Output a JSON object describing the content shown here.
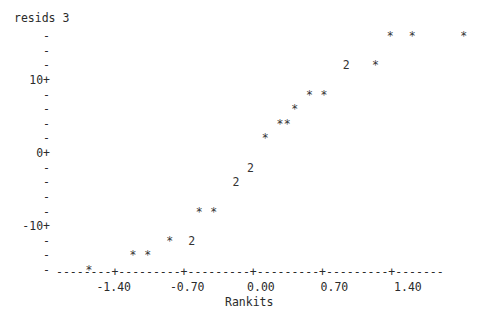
{
  "chart_data": {
    "type": "scatter",
    "title": "resids 3",
    "xlabel": "Rankits",
    "ylabel": "resids 3",
    "render_style": "ascii-character-plot",
    "point_marker": "*",
    "overlap_marker_note": "digit shows count of overlapping points",
    "xlim": [
      -1.75,
      -1.75
    ],
    "x_tick_labels": [
      "-1.40",
      "-0.70",
      "0.00",
      "0.70",
      "1.40"
    ],
    "x_tick_values": [
      -1.4,
      -0.7,
      0.0,
      0.7,
      1.4
    ],
    "y_tick_labels": [
      "10+",
      "0+",
      "-10+"
    ],
    "y_tick_values": [
      10,
      0,
      -10
    ],
    "grid": false,
    "legend": null,
    "points": [
      {
        "x": -1.75,
        "y": -14.5,
        "marker": "*",
        "count": 1
      },
      {
        "x": -1.33,
        "y": -13.0,
        "marker": "*",
        "count": 1
      },
      {
        "x": -1.1,
        "y": -13.0,
        "marker": "*",
        "count": 1
      },
      {
        "x": -0.92,
        "y": -11.5,
        "marker": "*",
        "count": 1
      },
      {
        "x": -0.66,
        "y": -11.5,
        "marker": "2",
        "count": 2
      },
      {
        "x": -0.5,
        "y": -8.5,
        "marker": "*",
        "count": 1
      },
      {
        "x": -0.34,
        "y": -8.5,
        "marker": "*",
        "count": 1
      },
      {
        "x": -0.16,
        "y": -5.5,
        "marker": "2",
        "count": 2
      },
      {
        "x": 0.06,
        "y": -4.0,
        "marker": "2",
        "count": 2
      },
      {
        "x": 0.11,
        "y": 1.0,
        "marker": "*",
        "count": 1
      },
      {
        "x": 0.2,
        "y": 2.5,
        "marker": "*",
        "count": 1
      },
      {
        "x": 0.28,
        "y": 2.5,
        "marker": "*",
        "count": 1
      },
      {
        "x": 0.37,
        "y": 4.0,
        "marker": "*",
        "count": 1
      },
      {
        "x": 0.5,
        "y": 5.5,
        "marker": "*",
        "count": 1
      },
      {
        "x": 0.62,
        "y": 5.5,
        "marker": "*",
        "count": 1
      },
      {
        "x": 0.8,
        "y": 8.5,
        "marker": "2",
        "count": 2
      },
      {
        "x": 1.1,
        "y": 8.5,
        "marker": "*",
        "count": 1
      },
      {
        "x": 1.28,
        "y": 11.5,
        "marker": "*",
        "count": 1
      },
      {
        "x": 1.5,
        "y": 11.5,
        "marker": "*",
        "count": 1
      },
      {
        "x": 2.0,
        "y": 11.5,
        "marker": "*",
        "count": 1
      }
    ]
  },
  "plot": {
    "title": "resids 3",
    "x_axis_title": "Rankits",
    "y_axis_rows": [
      {
        "label": "-",
        "kind": "minor"
      },
      {
        "label": "-",
        "kind": "minor"
      },
      {
        "label": "-",
        "kind": "minor"
      },
      {
        "label": "10+",
        "kind": "major"
      },
      {
        "label": "-",
        "kind": "minor"
      },
      {
        "label": "-",
        "kind": "minor"
      },
      {
        "label": "-",
        "kind": "minor"
      },
      {
        "label": "-",
        "kind": "minor"
      },
      {
        "label": "0+",
        "kind": "major"
      },
      {
        "label": "-",
        "kind": "minor"
      },
      {
        "label": "-",
        "kind": "minor"
      },
      {
        "label": "-",
        "kind": "minor"
      },
      {
        "label": "-",
        "kind": "minor"
      },
      {
        "label": "-10+",
        "kind": "major"
      },
      {
        "label": "-",
        "kind": "minor"
      },
      {
        "label": "-",
        "kind": "minor"
      },
      {
        "label": "-",
        "kind": "minor"
      }
    ],
    "axis_line": "--------+---------+---------+---------+---------+-------",
    "x_tick_labels": [
      "-1.40",
      "-0.70",
      "0.00",
      "0.70",
      "1.40"
    ],
    "data_rows": [
      {
        "row": 0,
        "marks": [
          {
            "col": 45,
            "ch": "*"
          },
          {
            "col": 48,
            "ch": "*"
          },
          {
            "col": 55,
            "ch": "*"
          }
        ]
      },
      {
        "row": 1,
        "marks": []
      },
      {
        "row": 2,
        "marks": [
          {
            "col": 39,
            "ch": "2"
          },
          {
            "col": 43,
            "ch": "*"
          }
        ]
      },
      {
        "row": 3,
        "marks": []
      },
      {
        "row": 4,
        "marks": [
          {
            "col": 34,
            "ch": "*"
          },
          {
            "col": 36,
            "ch": "*"
          }
        ]
      },
      {
        "row": 5,
        "marks": [
          {
            "col": 32,
            "ch": "*"
          }
        ]
      },
      {
        "row": 6,
        "marks": [
          {
            "col": 30,
            "ch": "*"
          },
          {
            "col": 31,
            "ch": "*"
          }
        ]
      },
      {
        "row": 7,
        "marks": [
          {
            "col": 28,
            "ch": "*"
          }
        ]
      },
      {
        "row": 8,
        "marks": []
      },
      {
        "row": 9,
        "marks": [
          {
            "col": 26,
            "ch": "2"
          }
        ]
      },
      {
        "row": 10,
        "marks": [
          {
            "col": 24,
            "ch": "2"
          }
        ]
      },
      {
        "row": 11,
        "marks": []
      },
      {
        "row": 12,
        "marks": [
          {
            "col": 19,
            "ch": "*"
          },
          {
            "col": 21,
            "ch": "*"
          }
        ]
      },
      {
        "row": 13,
        "marks": []
      },
      {
        "row": 14,
        "marks": [
          {
            "col": 15,
            "ch": "*"
          },
          {
            "col": 18,
            "ch": "2"
          }
        ]
      },
      {
        "row": 15,
        "marks": [
          {
            "col": 10,
            "ch": "*"
          },
          {
            "col": 12,
            "ch": "*"
          }
        ]
      },
      {
        "row": 16,
        "marks": [
          {
            "col": 4,
            "ch": "*"
          }
        ]
      }
    ]
  }
}
